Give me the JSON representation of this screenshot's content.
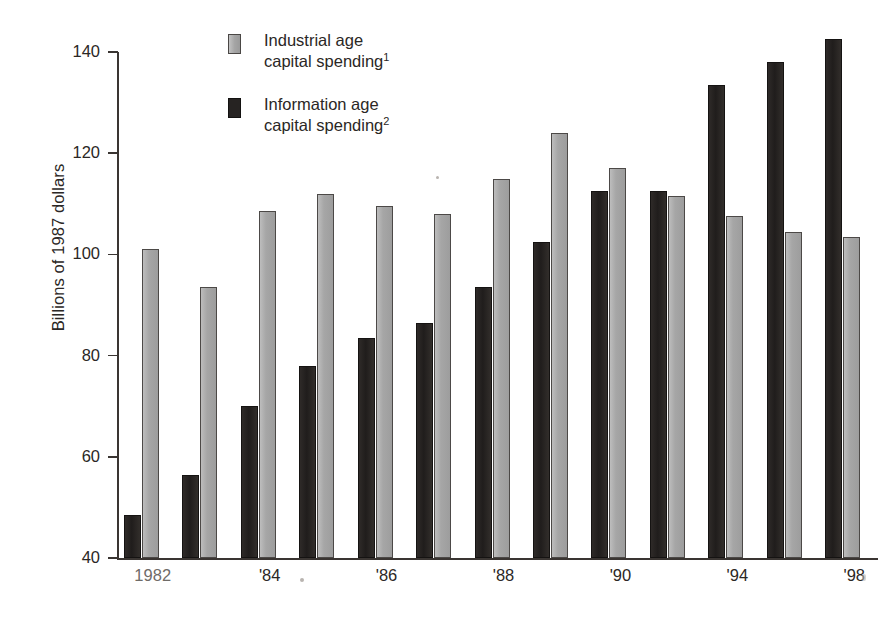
{
  "chart_data": {
    "type": "bar",
    "title": "",
    "subtitle": "",
    "xlabel": "",
    "ylabel": "Billions of 1987 dollars",
    "ylim": [
      40,
      140
    ],
    "yticks": [
      40,
      60,
      80,
      100,
      120,
      140
    ],
    "grid": false,
    "legend_position": "top-left-inside",
    "categories": [
      "1982",
      "1983",
      "1984",
      "1985",
      "1986",
      "1987",
      "1988",
      "1989",
      "1990",
      "1991",
      "1992"
    ],
    "x_tick_labels": [
      "1982",
      "'84",
      "'86",
      "'88",
      "'90",
      "'94",
      "'98"
    ],
    "series": [
      {
        "name": "Information age capital spending",
        "footnote": "2",
        "color": "#262322",
        "values": [
          48.5,
          56.5,
          70.0,
          78.0,
          83.5,
          86.5,
          93.5,
          102.5,
          112.5,
          112.5,
          133.5
        ]
      },
      {
        "name": "Industrial age capital spending",
        "footnote": "1",
        "color": "#a9a9a9",
        "values": [
          101.0,
          93.5,
          108.5,
          112.0,
          109.5,
          108.0,
          115.0,
          124.0,
          117.0,
          111.5,
          107.5
        ]
      }
    ],
    "extra_pairs": [
      {
        "category": "1996",
        "information_age": 138.0,
        "industrial_age": 104.5
      },
      {
        "category": "1998",
        "information_age": 142.5,
        "industrial_age": 103.5
      }
    ]
  },
  "axis": {
    "y_title": "Billions of 1987 dollars",
    "y_tick_labels": [
      "140",
      "120",
      "100",
      "80",
      "60",
      "40"
    ],
    "x_tick_labels": [
      "1982",
      "'84",
      "'86",
      "'88",
      "'90",
      "'94",
      "'98"
    ]
  },
  "legend": {
    "items": [
      {
        "swatch": "light",
        "line1": "Industrial age",
        "line2": "capital spending",
        "footnote": "1"
      },
      {
        "swatch": "dark",
        "line1": "Information age",
        "line2": "capital spending",
        "footnote": "2"
      }
    ]
  },
  "colors": {
    "information_age": "#262322",
    "industrial_age": "#a9a9a9",
    "axis": "#3a3532",
    "text": "#2b2725",
    "background": "#ffffff"
  },
  "bar_pairs": [
    {
      "label": "1982",
      "dark": 48.5,
      "light": 101.0
    },
    {
      "label": "1983",
      "dark": 56.5,
      "light": 93.5
    },
    {
      "label": "1984",
      "dark": 70.0,
      "light": 108.5
    },
    {
      "label": "1985",
      "dark": 78.0,
      "light": 112.0
    },
    {
      "label": "1986",
      "dark": 83.5,
      "light": 109.5
    },
    {
      "label": "1987",
      "dark": 86.5,
      "light": 108.0
    },
    {
      "label": "1988",
      "dark": 93.5,
      "light": 115.0
    },
    {
      "label": "1989",
      "dark": 102.5,
      "light": 124.0
    },
    {
      "label": "1990",
      "dark": 112.5,
      "light": 117.0
    },
    {
      "label": "1991",
      "dark": 112.5,
      "light": 111.5
    },
    {
      "label": "1994",
      "dark": 133.5,
      "light": 107.5
    },
    {
      "label": "1996",
      "dark": 138.0,
      "light": 104.5
    },
    {
      "label": "1998",
      "dark": 142.5,
      "light": 103.5
    }
  ]
}
